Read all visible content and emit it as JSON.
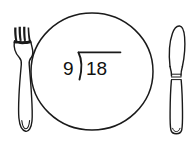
{
  "illustration": {
    "title": "Dinner plate with long division problem",
    "background_color": "#ffffff",
    "line_color": "#1a1a1a"
  },
  "plate": {
    "name": "dinner-plate",
    "shape": "circle",
    "center_x": 92,
    "center_y": 71,
    "radius_x": 61,
    "radius_y": 58
  },
  "math": {
    "expression": "9)18",
    "divisor": "9",
    "dividend": "18",
    "notation": "long-division",
    "divisor_label": "9",
    "dividend_label": "18"
  },
  "fork": {
    "name": "fork",
    "tine_count": 4,
    "position": "left"
  },
  "knife": {
    "name": "knife",
    "position": "right",
    "has_bolster_rings": true
  }
}
